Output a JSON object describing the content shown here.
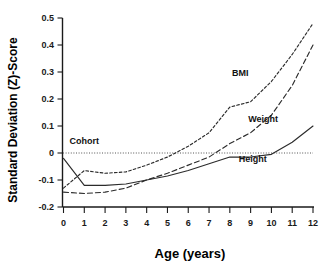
{
  "chart_data": {
    "type": "line",
    "title": "",
    "xlabel": "Age (years)",
    "ylabel": "Standard Deviation (Z)-Score",
    "xlim": [
      0,
      12
    ],
    "ylim": [
      -0.2,
      0.5
    ],
    "xticks": [
      "0",
      "1",
      "2",
      "3",
      "4",
      "5",
      "6",
      "7",
      "8",
      "9",
      "10",
      "11",
      "12"
    ],
    "yticks": [
      "0.5",
      "0.4",
      "0.3",
      "0.2",
      "0.1",
      "0",
      "-0.1",
      "-0.2"
    ],
    "grid": false,
    "legend_position": "inline-annotations",
    "annotations": [
      {
        "text": "Cohort",
        "x": 1.0,
        "y": 0.035
      },
      {
        "text": "BMI",
        "x": 8.5,
        "y": 0.285
      },
      {
        "text": "Weight",
        "x": 9.6,
        "y": 0.115
      },
      {
        "text": "Height",
        "x": 9.1,
        "y": -0.035
      }
    ],
    "reference_line": {
      "label": "Cohort",
      "y": 0,
      "style": "dotted"
    },
    "x": [
      0,
      1,
      2,
      3,
      4,
      5,
      6,
      7,
      8,
      9,
      10,
      11,
      12
    ],
    "series": [
      {
        "name": "Height",
        "style": "solid",
        "values": [
          -0.02,
          -0.12,
          -0.12,
          -0.115,
          -0.1,
          -0.085,
          -0.065,
          -0.04,
          -0.015,
          -0.015,
          -0.005,
          0.04,
          0.1
        ]
      },
      {
        "name": "Weight",
        "style": "dashed",
        "values": [
          -0.145,
          -0.15,
          -0.145,
          -0.13,
          -0.1,
          -0.075,
          -0.045,
          -0.015,
          0.035,
          0.075,
          0.14,
          0.25,
          0.4
        ]
      },
      {
        "name": "BMI",
        "style": "dotted",
        "values": [
          -0.13,
          -0.065,
          -0.075,
          -0.07,
          -0.045,
          -0.015,
          0.025,
          0.075,
          0.17,
          0.19,
          0.265,
          0.365,
          0.48
        ]
      }
    ]
  },
  "axes": {
    "y_title": "Standard Deviation (Z)-Score",
    "x_title": "Age (years)"
  }
}
